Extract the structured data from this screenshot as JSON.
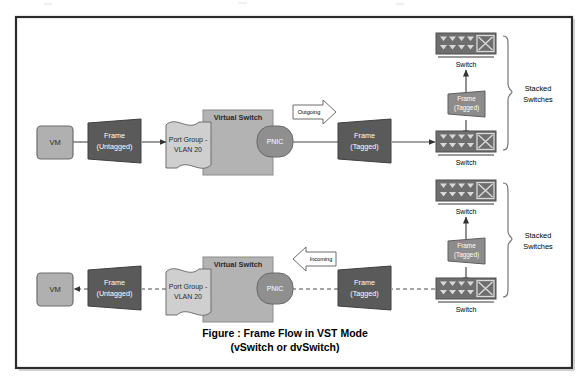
{
  "figure": {
    "caption_line1": "Figure : Frame Flow in VST Mode",
    "caption_line2": "(vSwitch or dvSwitch)"
  },
  "colors": {
    "page_background": "#ffffff",
    "outer_border": "#2b2b2b",
    "vm_fill": "#b0b0b0",
    "frame_fill": "#5a5a5a",
    "portgroup_fill": "#cfcfcf",
    "vswitch_fill": "#b3b3b3",
    "pnic_fill": "#8f8f8f",
    "switch_body_fill": "#6e6e6e",
    "switch_port_fill": "#d9d9d9",
    "arrow_callout_fill": "#ffffff",
    "line": "#4a4a4a",
    "text_light": "#ffffff",
    "text_dark": "#2a2a2a"
  },
  "flows": [
    {
      "id": "outgoing",
      "direction_label": "Outgoing",
      "line_style": "solid",
      "vm": {
        "label": "VM"
      },
      "frame_in": {
        "line1": "Frame",
        "line2": "(Untagged)"
      },
      "port_group": {
        "line1": "Port Group -",
        "line2": "VLAN 20"
      },
      "virtual_switch": {
        "label": "Virtual Switch"
      },
      "pnic": {
        "label": "PNIC"
      },
      "frame_out": {
        "line1": "Frame",
        "line2": "(Tagged)"
      },
      "switch_top": {
        "label": "Switch"
      },
      "switch_bottom": {
        "label": "Switch"
      },
      "frame_between": {
        "line1": "Frame",
        "line2": "(Tagged)"
      },
      "stack": {
        "line1": "Stacked",
        "line2": "Switches"
      }
    },
    {
      "id": "incoming",
      "direction_label": "Incoming",
      "line_style": "dashed",
      "vm": {
        "label": "VM"
      },
      "frame_in": {
        "line1": "Frame",
        "line2": "(Untagged)"
      },
      "port_group": {
        "line1": "Port Group -",
        "line2": "VLAN 20"
      },
      "virtual_switch": {
        "label": "Virtual Switch"
      },
      "pnic": {
        "label": "PNIC"
      },
      "frame_out": {
        "line1": "Frame",
        "line2": "(Tagged)"
      },
      "switch_top": {
        "label": "Switch"
      },
      "switch_bottom": {
        "label": "Switch"
      },
      "frame_between": {
        "line1": "Frame",
        "line2": "(Tagged)"
      },
      "stack": {
        "line1": "Stacked",
        "line2": "Switches"
      }
    }
  ],
  "icons": {
    "switch_icon": "network-switch-icon",
    "arrow_callout": "block-arrow-icon",
    "brace": "curly-brace-icon"
  }
}
